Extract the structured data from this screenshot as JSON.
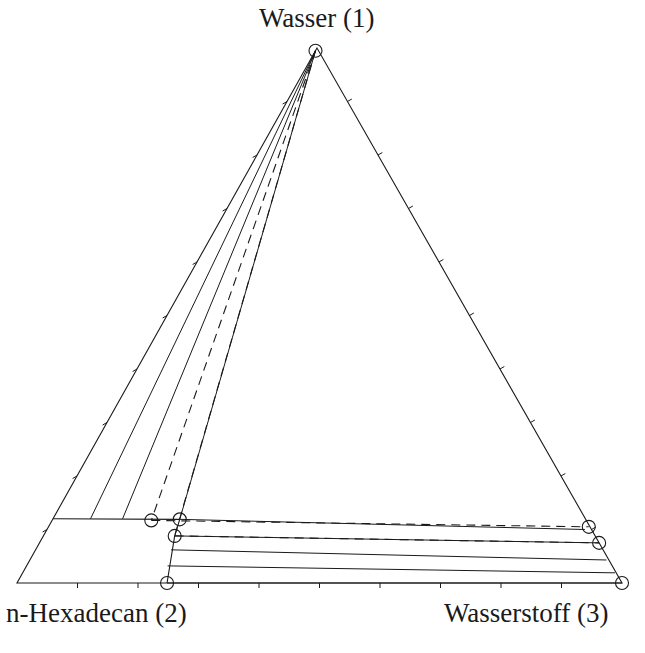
{
  "chart_data": {
    "type": "ternary",
    "title": "",
    "components": [
      {
        "id": 1,
        "label": "Wasser (1)",
        "vertex": "top"
      },
      {
        "id": 2,
        "label": "n-Hexadecan (2)",
        "vertex": "bottom-left"
      },
      {
        "id": 3,
        "label": "Wasserstoff (3)",
        "vertex": "bottom-right"
      }
    ],
    "tick_step": 0.1,
    "colors": {
      "line": "#1a1a1a",
      "background": "#ffffff"
    },
    "three_phase_region": {
      "note": "Horizontal line at water fraction ~0.12 bounding the hexadecan-rich corner",
      "x1": 0.12
    },
    "phase_points": [
      {
        "name": "water-phase",
        "x1": 0.995,
        "x3": 0.0,
        "marker": "circle"
      },
      {
        "name": "hex-phase-a",
        "x1": 0.117,
        "x3": 0.164,
        "marker": "circle"
      },
      {
        "name": "hex-phase-b",
        "x1": 0.119,
        "x3": 0.21,
        "marker": "circle"
      },
      {
        "name": "hex-phase-c",
        "x1": 0.088,
        "x3": 0.217,
        "marker": "circle"
      },
      {
        "name": "hex-phase-d",
        "x1": 0.0,
        "x3": 0.248,
        "marker": "circle"
      },
      {
        "name": "gas-phase-a",
        "x1": 0.105,
        "x3": 0.893,
        "marker": "circle"
      },
      {
        "name": "gas-phase-b",
        "x1": 0.075,
        "x3": 0.925,
        "marker": "circle"
      },
      {
        "name": "gas-phase-c",
        "x1": 0.0,
        "x3": 1.0,
        "marker": "circle"
      }
    ],
    "tie_lines": [
      {
        "from": {
          "x1": 0.995,
          "x3": 0.0
        },
        "to": {
          "x1": 0.12,
          "x3": 0.062
        },
        "style": "solid"
      },
      {
        "from": {
          "x1": 0.995,
          "x3": 0.0
        },
        "to": {
          "x1": 0.12,
          "x3": 0.115
        },
        "style": "solid"
      },
      {
        "from": {
          "x1": 0.995,
          "x3": 0.0
        },
        "to": {
          "x1": 0.117,
          "x3": 0.164
        },
        "style": "dashed"
      },
      {
        "from": {
          "x1": 0.995,
          "x3": 0.0
        },
        "to": {
          "x1": 0.119,
          "x3": 0.21
        },
        "style": "solid"
      },
      {
        "from": {
          "x1": 0.995,
          "x3": 0.0
        },
        "to": {
          "x1": 0.088,
          "x3": 0.217
        },
        "style": "dashed"
      },
      {
        "from": {
          "x1": 0.117,
          "x3": 0.164
        },
        "to": {
          "x1": 0.105,
          "x3": 0.893
        },
        "style": "dashed"
      },
      {
        "from": {
          "x1": 0.119,
          "x3": 0.21
        },
        "to": {
          "x1": 0.1,
          "x3": 0.889
        },
        "style": "solid"
      },
      {
        "from": {
          "x1": 0.088,
          "x3": 0.217
        },
        "to": {
          "x1": 0.075,
          "x3": 0.925
        },
        "style": "dashed"
      },
      {
        "from": {
          "x1": 0.088,
          "x3": 0.217
        },
        "to": {
          "x1": 0.075,
          "x3": 0.925
        },
        "style": "solid"
      },
      {
        "from": {
          "x1": 0.062,
          "x3": 0.224
        },
        "to": {
          "x1": 0.043,
          "x3": 0.953
        },
        "style": "solid"
      },
      {
        "from": {
          "x1": 0.032,
          "x3": 0.233
        },
        "to": {
          "x1": 0.019,
          "x3": 0.979
        },
        "style": "solid"
      },
      {
        "from": {
          "x1": 0.0,
          "x3": 0.248
        },
        "to": {
          "x1": 0.0,
          "x3": 1.0
        },
        "style": "solid"
      }
    ],
    "boundaries": [
      {
        "name": "hex-rich-boundary",
        "points": [
          {
            "x1": 0.0,
            "x3": 0.248
          },
          {
            "x1": 0.088,
            "x3": 0.217
          },
          {
            "x1": 0.119,
            "x3": 0.21
          }
        ],
        "style": "solid"
      },
      {
        "name": "three-phase-line",
        "points": [
          {
            "x1": 0.12,
            "x3": 0.0
          },
          {
            "x1": 0.119,
            "x3": 0.21
          }
        ],
        "style": "solid"
      },
      {
        "name": "corner-line",
        "points": [
          {
            "x1": 0.12,
            "x3": 0.0
          },
          {
            "x1": 0.0,
            "x3": 0.248
          }
        ],
        "style": "none"
      }
    ]
  }
}
